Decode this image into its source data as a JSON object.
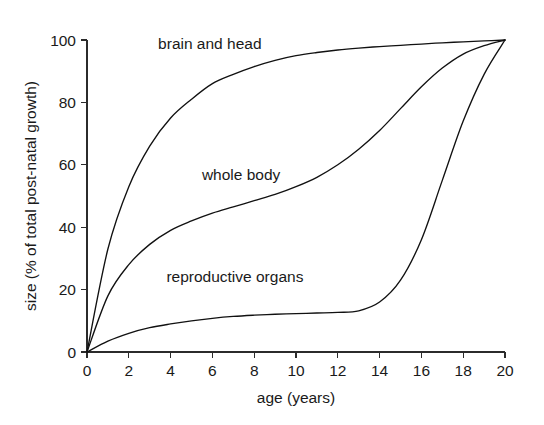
{
  "chart_data": {
    "type": "line",
    "title": "",
    "subtitle": "",
    "xlabel": "age (years)",
    "ylabel": "size (% of total post-natal growth)",
    "xlim": [
      0,
      20
    ],
    "ylim": [
      0,
      100
    ],
    "xticks": [
      "0",
      "2",
      "4",
      "6",
      "8",
      "10",
      "12",
      "14",
      "16",
      "18",
      "20"
    ],
    "yticks": [
      "0",
      "20",
      "40",
      "60",
      "80",
      "100"
    ],
    "xtick_values": [
      0,
      2,
      4,
      6,
      8,
      10,
      12,
      14,
      16,
      18,
      20
    ],
    "ytick_values": [
      0,
      20,
      40,
      60,
      80,
      100
    ],
    "grid": false,
    "legend_position": "inline-annotations",
    "x": [
      0,
      1,
      2,
      3,
      4,
      5,
      6,
      7,
      8,
      9,
      10,
      11,
      12,
      13,
      14,
      15,
      16,
      17,
      18,
      19,
      20
    ],
    "series": [
      {
        "name": "brain and head",
        "color": "#111111",
        "values": [
          0,
          33,
          53,
          66,
          75,
          81,
          86,
          89,
          91.5,
          93.5,
          95,
          96,
          96.8,
          97.4,
          97.9,
          98.3,
          98.7,
          99.1,
          99.4,
          99.7,
          100
        ]
      },
      {
        "name": "whole body",
        "color": "#111111",
        "values": [
          0,
          18,
          28,
          34.5,
          39,
          42,
          44.5,
          46.5,
          48.5,
          50.5,
          53,
          56,
          60,
          65,
          71,
          78,
          85,
          91,
          95.5,
          98.2,
          100
        ]
      },
      {
        "name": "reproductive organs",
        "color": "#111111",
        "values": [
          0,
          3.5,
          6,
          7.8,
          9,
          10,
          10.8,
          11.4,
          11.8,
          12.1,
          12.3,
          12.5,
          12.7,
          13.2,
          16,
          23,
          36,
          55,
          74,
          89,
          100
        ]
      }
    ],
    "annotations": [
      {
        "text": "brain and head",
        "x": 3.4,
        "y": 97
      },
      {
        "text": "whole body",
        "x": 5.5,
        "y": 55
      },
      {
        "text": "reproductive organs",
        "x": 3.8,
        "y": 22.5
      }
    ]
  },
  "axes": {
    "x_title": "age (years)",
    "y_title": "size (% of total post-natal growth)"
  },
  "labels": {
    "brain_and_head": "brain and head",
    "whole_body": "whole body",
    "reproductive_organs": "reproductive organs"
  },
  "yticks": {
    "t0": "0",
    "t20": "20",
    "t40": "40",
    "t60": "60",
    "t80": "80",
    "t100": "100"
  },
  "xticks": {
    "t0": "0",
    "t2": "2",
    "t4": "4",
    "t6": "6",
    "t8": "8",
    "t10": "10",
    "t12": "12",
    "t14": "14",
    "t16": "16",
    "t18": "18",
    "t20": "20"
  },
  "colors": {
    "curve": "#111111",
    "axis": "#2b2b2b",
    "text": "#1a1a1a",
    "background": "#ffffff"
  }
}
